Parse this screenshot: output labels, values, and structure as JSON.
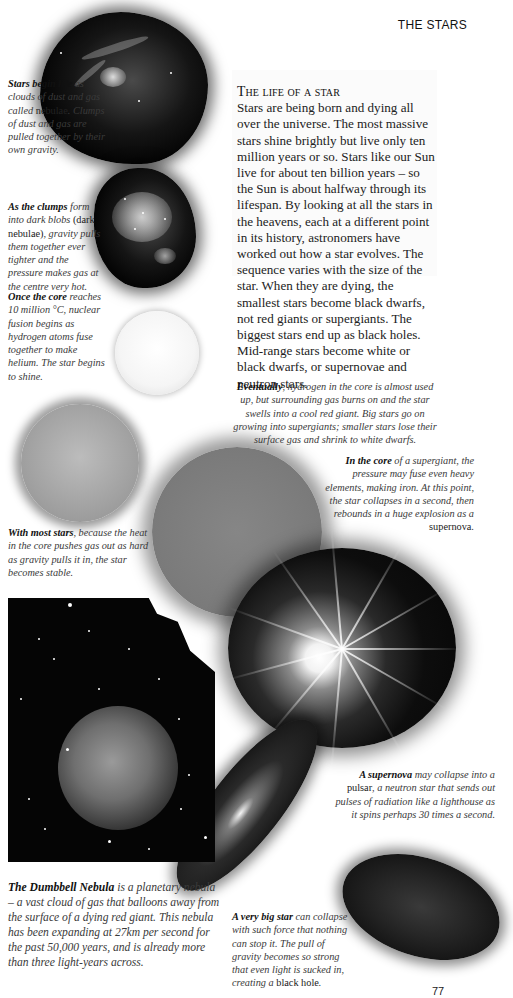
{
  "running_head": "THE STARS",
  "page_number": "77",
  "intro": {
    "heading": "The life of a star",
    "body": "Stars are being born and dying all over the universe. The most massive stars shine brightly but live only ten million years or so. Stars like our Sun live for about ten billion years – so the Sun is about halfway through its lifespan. By looking at all the stars in the heavens, each at a different point in its history, astronomers have worked out how a star evolves. The sequence varies with the size of the star. When they are dying, the smallest stars become black dwarfs, not red giants or supergiants. The biggest stars end up as black holes. Mid-range stars become white or black dwarfs, or supernovae and neutron stars."
  },
  "captions": {
    "nebulae": {
      "lead": "Stars begin life",
      "text1": " as clouds of dust and gas called ",
      "roman": "nebulae",
      "text2": ". Clumps of dust and gas are pulled together by their own gravity."
    },
    "clumps": {
      "lead": "As the clumps",
      "text1": " form into dark blobs ",
      "roman": "(dark nebulae)",
      "text2": ", gravity pulls them together ever tighter and the pressure makes gas at the centre very hot."
    },
    "core": {
      "lead": "Once the core",
      "text": " reaches 10 million °C, nuclear fusion begins as hydrogen atoms fuse together to make helium. The star begins to shine."
    },
    "stable": {
      "lead": "With most stars",
      "text": ", because the heat in the core pushes gas out as hard as gravity pulls it in, the star becomes stable."
    },
    "eventually": {
      "lead": "Eventually",
      "text": ", hydrogen in the core is almost used up, but surrounding gas burns on and the star swells into a cool red giant. Big stars go on growing into supergiants; smaller stars lose their surface gas and shrink to white dwarfs."
    },
    "supergiant": {
      "lead": "In the core",
      "text": " of a supergiant, the pressure may fuse even heavy elements, making iron. At this point, the star collapses in a second, then rebounds in a huge explosion as a ",
      "roman": "supernova",
      "end": "."
    },
    "pulsar": {
      "lead": "A supernova",
      "text1": " may collapse into a ",
      "roman": "pulsar",
      "text2": ", a neutron star that sends out pulses of radiation like a lighthouse as it spins perhaps 30 times a second."
    },
    "dumbbell": {
      "lead": "The Dumbbell Nebula",
      "text": " is a planetary nebula – a vast cloud of gas that balloons away from the surface of a dying red giant. This nebula has been expanding at 27km per second for the past 50,000 years, and is already more than three light-years across."
    },
    "blackhole": {
      "lead": "A very big star",
      "text": " can collapse with such force that nothing can stop it. The pull of gravity becomes so strong that even light is sucked in, creating a ",
      "roman": "black hole",
      "end": "."
    }
  },
  "illustrations": [
    {
      "id": "nebula-cloud",
      "label": "nebula"
    },
    {
      "id": "dark-nebula-clump",
      "label": "dark nebula"
    },
    {
      "id": "new-star",
      "label": "young star"
    },
    {
      "id": "stable-star",
      "label": "stable star"
    },
    {
      "id": "red-giant",
      "label": "red giant / supergiant"
    },
    {
      "id": "supernova",
      "label": "supernova"
    },
    {
      "id": "pulsar",
      "label": "pulsar"
    },
    {
      "id": "black-hole",
      "label": "black hole"
    },
    {
      "id": "dumbbell-nebula-photo",
      "label": "Dumbbell Nebula"
    }
  ]
}
